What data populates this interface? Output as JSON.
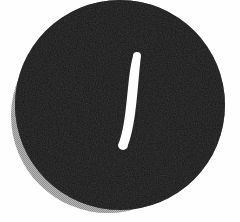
{
  "canvas": {
    "width": 240,
    "height": 222,
    "background_color": "#fefefe",
    "alt_text": "Black circular button with a white diagonal slash mark and a gray drop shadow"
  },
  "shadow": {
    "name": "drop-shadow",
    "shape": "circle",
    "center_x": 108,
    "center_y": 116,
    "radius": 97,
    "color": "#a3a3a3",
    "pattern": "halftone-dither",
    "offset_x": -12,
    "offset_y": 11
  },
  "disc": {
    "name": "black-disc",
    "shape": "circle",
    "center_x": 120,
    "center_y": 105,
    "radius": 105,
    "color": "#0d0d0d",
    "texture": "noise-grain"
  },
  "mark": {
    "name": "slash-stroke",
    "shape": "tapered-curved-stroke",
    "color": "#fdfdfd",
    "top_x": 137,
    "top_y": 52,
    "bottom_x": 123,
    "bottom_y": 150,
    "top_width": 8,
    "mid_width": 9,
    "bottom_width": 10,
    "angle_degrees": 8,
    "cap": "round"
  }
}
